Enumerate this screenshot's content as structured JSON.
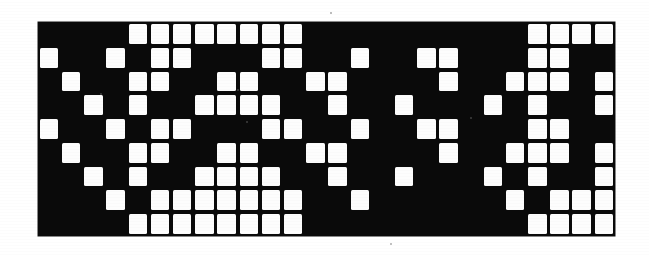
{
  "figure": {
    "kind": "binary-cell-matrix",
    "plate_color": "#0a0a0a",
    "cell_color": "#fdfdfd",
    "background_color": "#ffffff"
  },
  "grid": {
    "columns": 26,
    "rows": 9,
    "cell_pitch_px": 22.2,
    "plate_left_px": 38,
    "plate_top_px": 22,
    "plate_width_px": 577,
    "plate_height_px": 214
  },
  "chart_data": {
    "type": "heatmap",
    "title": "",
    "xlabel": "",
    "ylabel": "",
    "legend": [],
    "grid_on": false,
    "columns": 26,
    "rows": 9,
    "value_labels": {
      "0": "black (off)",
      "1": "white (on)"
    },
    "matrix": [
      [
        0,
        0,
        0,
        0,
        1,
        1,
        1,
        1,
        1,
        1,
        1,
        1,
        0,
        0,
        0,
        0,
        0,
        0,
        0,
        0,
        0,
        0,
        1,
        1,
        1,
        1
      ],
      [
        1,
        0,
        0,
        1,
        0,
        1,
        1,
        0,
        0,
        0,
        1,
        1,
        0,
        0,
        1,
        0,
        0,
        1,
        1,
        0,
        0,
        0,
        1,
        1,
        0,
        0
      ],
      [
        0,
        1,
        0,
        0,
        1,
        1,
        0,
        0,
        1,
        1,
        0,
        0,
        1,
        1,
        0,
        0,
        0,
        0,
        1,
        0,
        0,
        1,
        1,
        1,
        0,
        1
      ],
      [
        0,
        0,
        1,
        0,
        1,
        0,
        0,
        1,
        1,
        1,
        1,
        0,
        0,
        1,
        0,
        0,
        1,
        0,
        0,
        0,
        1,
        0,
        1,
        0,
        0,
        1
      ],
      [
        1,
        0,
        0,
        1,
        0,
        1,
        1,
        0,
        0,
        0,
        1,
        1,
        0,
        0,
        1,
        0,
        0,
        1,
        1,
        0,
        0,
        0,
        1,
        1,
        0,
        0
      ],
      [
        0,
        1,
        0,
        0,
        1,
        1,
        0,
        0,
        1,
        1,
        0,
        0,
        1,
        1,
        0,
        0,
        0,
        0,
        1,
        0,
        0,
        1,
        1,
        1,
        0,
        1
      ],
      [
        0,
        0,
        1,
        0,
        1,
        0,
        0,
        1,
        1,
        1,
        1,
        0,
        0,
        1,
        0,
        0,
        1,
        0,
        0,
        0,
        1,
        0,
        1,
        0,
        0,
        1
      ],
      [
        0,
        0,
        0,
        1,
        0,
        1,
        1,
        1,
        1,
        1,
        1,
        1,
        0,
        0,
        1,
        0,
        0,
        0,
        0,
        0,
        0,
        1,
        0,
        1,
        1,
        1
      ],
      [
        0,
        0,
        0,
        0,
        1,
        1,
        1,
        1,
        1,
        1,
        1,
        1,
        0,
        0,
        0,
        0,
        0,
        0,
        0,
        0,
        0,
        0,
        1,
        1,
        1,
        1
      ]
    ]
  },
  "specks": [
    {
      "x": 100,
      "y": 93,
      "size": 2.4
    },
    {
      "x": 246,
      "y": 121,
      "size": 2.0
    },
    {
      "x": 237,
      "y": 89,
      "size": 1.8
    },
    {
      "x": 470,
      "y": 117,
      "size": 2.2
    },
    {
      "x": 330,
      "y": 12,
      "size": 1.6
    },
    {
      "x": 390,
      "y": 243,
      "size": 1.8
    }
  ]
}
